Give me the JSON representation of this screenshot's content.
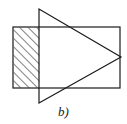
{
  "figure": {
    "caption": "b)",
    "background_color": "#ffffff",
    "stroke_color": "#1a1a1a",
    "hatch_color": "#1a1a1a",
    "canvas": {
      "width": 127,
      "height": 124
    },
    "shapes": {
      "rectangle": {
        "label": "rectangle",
        "x": 13,
        "y": 27,
        "width": 107,
        "height": 61,
        "stroke_width": 1.2,
        "fill": "none"
      },
      "triangle": {
        "label": "triangle",
        "points": "39,9 39,103 121,57",
        "vertices": [
          {
            "x": 39,
            "y": 9
          },
          {
            "x": 39,
            "y": 103
          },
          {
            "x": 121,
            "y": 57
          }
        ],
        "stroke_width": 1.2,
        "fill": "none"
      },
      "hatched_region": {
        "label": "intersection-complement-hatched",
        "x": 13.6,
        "y": 27.6,
        "width": 25.8,
        "height": 60,
        "pattern": "diagonal-forward-slash",
        "pattern_spacing": 6,
        "pattern_stroke_width": 1.1
      }
    }
  }
}
